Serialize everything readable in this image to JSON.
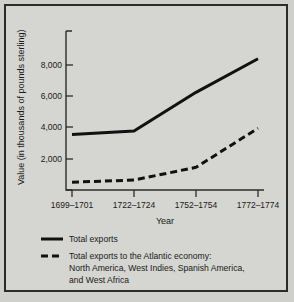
{
  "chart_data": {
    "type": "line",
    "title": "",
    "xlabel": "Year",
    "ylabel": "Value (in thousands of pounds sterling)",
    "categories": [
      "1699–1701",
      "1722–1724",
      "1752–1754",
      "1772–1774"
    ],
    "yticks": [
      "2,000",
      "4,000",
      "6,000",
      "8,000"
    ],
    "ytick_values": [
      2000,
      4000,
      6000,
      8000
    ],
    "ylim": [
      0,
      9000
    ],
    "grid": false,
    "legend_position": "below",
    "series": [
      {
        "name": "Total exports",
        "style": "solid",
        "values": [
          3550,
          3780,
          6250,
          8400
        ]
      },
      {
        "name": "Total exports to the Atlantic economy: North America, West Indies, Spanish America, and West Africa",
        "style": "dashed",
        "values": [
          500,
          640,
          1450,
          3950
        ]
      }
    ]
  },
  "axes": {
    "ylabel": "Value (in thousands of pounds sterling)",
    "xlabel": "Year",
    "ytick_labels": [
      "8,000",
      "6,000",
      "4,000",
      "2,000"
    ],
    "xtick_labels": [
      "1699–1701",
      "1722–1724",
      "1752–1754",
      "1772–1774"
    ]
  },
  "legend": {
    "items": [
      {
        "marker": "solid-line-swatch",
        "line1": "Total exports",
        "line2": "",
        "line3": ""
      },
      {
        "marker": "dashed-line-swatch",
        "line1": "Total exports to the Atlantic economy:",
        "line2": "North America, West Indies, Spanish America,",
        "line3": "and West Africa"
      }
    ]
  },
  "colors": {
    "page_background": "#cfcfcb",
    "panel_background": "#d5d5d1",
    "frame_border": "#2b2b2b",
    "series_line": "#111111",
    "text": "#1a1a1a"
  }
}
